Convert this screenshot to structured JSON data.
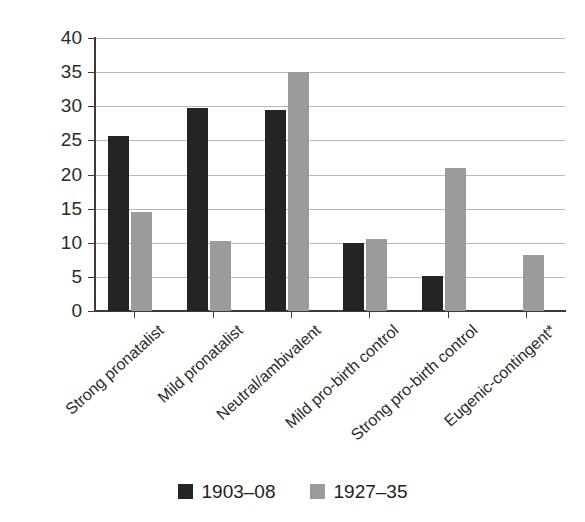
{
  "chart_data": {
    "type": "bar",
    "title": "",
    "xlabel": "",
    "ylabel": "",
    "ylim": [
      0,
      40
    ],
    "ytick_step": 5,
    "yticks": [
      40,
      35,
      30,
      25,
      20,
      15,
      10,
      5,
      0
    ],
    "grid": true,
    "legend_position": "bottom-center",
    "categories": [
      "Strong pronatalist",
      "Mild pronatalist",
      "Neutral/ambivalent",
      "Mild pro-birth control",
      "Strong pro-birth control",
      "Eugenic-contingent*"
    ],
    "series": [
      {
        "name": "1903–08",
        "color": "#242424",
        "values": [
          25.6,
          29.8,
          29.4,
          10.0,
          5.2,
          0
        ]
      },
      {
        "name": "1927–35",
        "color": "#9b9b9b",
        "values": [
          14.5,
          10.3,
          35.0,
          10.5,
          20.9,
          8.2
        ]
      }
    ]
  },
  "legend": {
    "items": [
      {
        "label": "1903–08",
        "swatch": "dark"
      },
      {
        "label": "1927–35",
        "swatch": "light"
      }
    ]
  },
  "colors": {
    "series_dark": "#242424",
    "series_light": "#9b9b9b",
    "axis": "#3b3b3b",
    "grid": "#b9b9b9",
    "text": "#2b2b2b",
    "background": "#ffffff"
  }
}
